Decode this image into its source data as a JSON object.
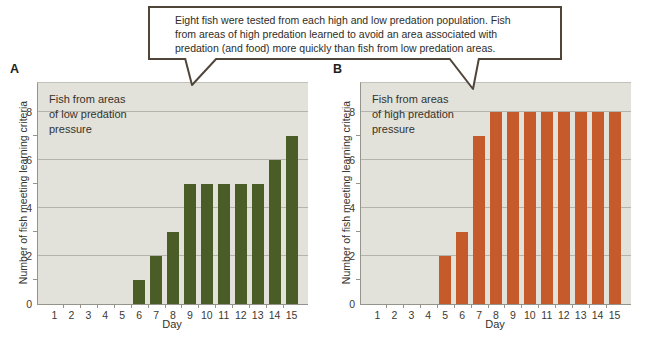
{
  "figure": {
    "callout_lines": [
      "Eight fish were tested from each high and low predation population. Fish",
      "from areas of high predation learned to avoid an area associated with",
      "predation (and food) more quickly than fish from low predation areas."
    ]
  },
  "chart_data": [
    {
      "type": "bar",
      "panel_label": "A",
      "annotation": "Fish from areas\nof low predation\npressure",
      "categories": [
        "1",
        "2",
        "3",
        "4",
        "5",
        "6",
        "7",
        "8",
        "9",
        "10",
        "11",
        "12",
        "13",
        "14",
        "15"
      ],
      "values": [
        0,
        0,
        0,
        0,
        0,
        1,
        2,
        3,
        5,
        5,
        5,
        5,
        5,
        6,
        7
      ],
      "title": "",
      "xlabel": "Day",
      "ylabel": "Number of fish meeting learning criteria",
      "ylim": [
        0,
        8
      ],
      "yticks": [
        0,
        2,
        4,
        6,
        8
      ],
      "grid": true,
      "legend": "none",
      "bar_color": "#4b5d26"
    },
    {
      "type": "bar",
      "panel_label": "B",
      "annotation": "Fish from areas\nof high predation\npressure",
      "categories": [
        "1",
        "2",
        "3",
        "4",
        "5",
        "6",
        "7",
        "8",
        "9",
        "10",
        "11",
        "12",
        "13",
        "14",
        "15"
      ],
      "values": [
        0,
        0,
        0,
        0,
        2,
        3,
        7,
        8,
        8,
        8,
        8,
        8,
        8,
        8,
        8
      ],
      "title": "",
      "xlabel": "Day",
      "ylabel": "Number of fish meeting learning criteria",
      "ylim": [
        0,
        8
      ],
      "yticks": [
        0,
        2,
        4,
        6,
        8
      ],
      "grid": true,
      "legend": "none",
      "bar_color": "#c55b2a"
    }
  ],
  "colors": {
    "page_bg": "#ffffff",
    "plot_bg": "#e3e2da",
    "gridline": "#b5b4ac",
    "axis": "#95948a",
    "text": "#3b3a33",
    "callout_border": "#4f4539",
    "bar_low_predation": "#4b5d26",
    "bar_high_predation": "#c55b2a"
  }
}
